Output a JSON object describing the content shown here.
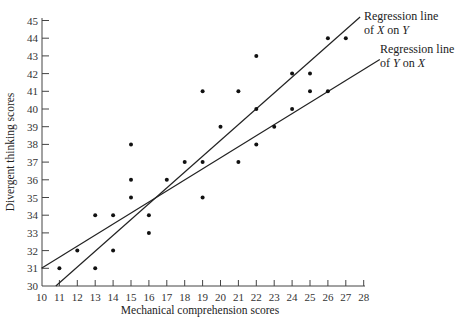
{
  "chart_data": {
    "type": "scatter",
    "title": "",
    "xlabel": "Mechanical comprehension scores",
    "ylabel": "Divergent thinking scores",
    "xlim": [
      10,
      28
    ],
    "ylim": [
      30,
      45
    ],
    "x_ticks": [
      10,
      11,
      12,
      13,
      14,
      15,
      16,
      17,
      18,
      19,
      20,
      21,
      22,
      23,
      24,
      25,
      26,
      27,
      28
    ],
    "y_ticks": [
      30,
      31,
      32,
      33,
      34,
      35,
      36,
      37,
      38,
      39,
      40,
      41,
      42,
      43,
      44,
      45
    ],
    "grid": false,
    "points": [
      {
        "x": 11,
        "y": 31
      },
      {
        "x": 12,
        "y": 32
      },
      {
        "x": 13,
        "y": 34
      },
      {
        "x": 13,
        "y": 31
      },
      {
        "x": 14,
        "y": 34
      },
      {
        "x": 14,
        "y": 32
      },
      {
        "x": 15,
        "y": 38
      },
      {
        "x": 15,
        "y": 36
      },
      {
        "x": 15,
        "y": 35
      },
      {
        "x": 16,
        "y": 34
      },
      {
        "x": 16,
        "y": 33
      },
      {
        "x": 17,
        "y": 36
      },
      {
        "x": 18,
        "y": 37
      },
      {
        "x": 19,
        "y": 37
      },
      {
        "x": 19,
        "y": 35
      },
      {
        "x": 19,
        "y": 41
      },
      {
        "x": 20,
        "y": 39
      },
      {
        "x": 21,
        "y": 41
      },
      {
        "x": 21,
        "y": 37
      },
      {
        "x": 22,
        "y": 43
      },
      {
        "x": 22,
        "y": 40
      },
      {
        "x": 22,
        "y": 38
      },
      {
        "x": 23,
        "y": 39
      },
      {
        "x": 24,
        "y": 42
      },
      {
        "x": 24,
        "y": 40
      },
      {
        "x": 25,
        "y": 42
      },
      {
        "x": 25,
        "y": 41
      },
      {
        "x": 26,
        "y": 44
      },
      {
        "x": 26,
        "y": 41
      },
      {
        "x": 27,
        "y": 44
      }
    ],
    "series": [
      {
        "name": "Regression line of X on Y",
        "type": "line",
        "x": [
          10.8,
          27.8
        ],
        "y": [
          30,
          45.2
        ]
      },
      {
        "name": "Regression line of Y on X",
        "type": "line",
        "x": [
          10,
          28.9
        ],
        "y": [
          31,
          42.8
        ]
      }
    ],
    "annotations": [
      {
        "text_line1": "Regression line",
        "text_line2_pre": "of ",
        "var1": "X",
        "mid": " on ",
        "var2": "Y"
      },
      {
        "text_line1": "Regression line",
        "text_line2_pre": "of ",
        "var1": "Y",
        "mid": " on ",
        "var2": "X"
      }
    ]
  }
}
